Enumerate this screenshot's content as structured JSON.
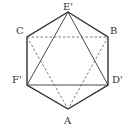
{
  "diagram": {
    "vertices": {
      "E'": {
        "label": "E'",
        "x": 68,
        "y": 12
      },
      "B": {
        "label": "B",
        "x": 108,
        "y": 37
      },
      "D'": {
        "label": "D'",
        "x": 108,
        "y": 85
      },
      "A": {
        "label": "A",
        "x": 68,
        "y": 109
      },
      "F'": {
        "label": "F'",
        "x": 27,
        "y": 85
      },
      "C": {
        "label": "C",
        "x": 27,
        "y": 37
      }
    },
    "labels": {
      "E": "E'",
      "B": "B",
      "D": "D'",
      "A": "A",
      "F": "F'",
      "C": "C"
    },
    "solid_edges": [
      [
        "E'",
        "B"
      ],
      [
        "B",
        "D'"
      ],
      [
        "D'",
        "A"
      ],
      [
        "A",
        "F'"
      ],
      [
        "F'",
        "C"
      ],
      [
        "C",
        "E'"
      ],
      [
        "E'",
        "F'"
      ],
      [
        "E'",
        "D'"
      ],
      [
        "F'",
        "D'"
      ]
    ],
    "dashed_edges": [
      [
        "C",
        "B"
      ],
      [
        "C",
        "A"
      ],
      [
        "B",
        "A"
      ]
    ],
    "colors": {
      "line": "#333333",
      "background": "#ffffff"
    }
  }
}
